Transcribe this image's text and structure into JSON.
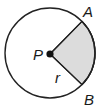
{
  "diagram": {
    "type": "circle-sector",
    "circle": {
      "cx": 50,
      "cy": 53,
      "r": 45,
      "stroke": "#222222",
      "fill": "#ffffff"
    },
    "sector": {
      "fill": "#dcdcdc",
      "stroke": "#222222"
    },
    "points": {
      "A": {
        "x": 82,
        "y": 21
      },
      "B": {
        "x": 82,
        "y": 85
      },
      "P": {
        "x": 50,
        "y": 54
      }
    },
    "labels": {
      "center": "P",
      "point_a": "A",
      "point_b": "B",
      "radius": "r"
    },
    "colors": {
      "line": "#222222",
      "shade": "#dcdcdc",
      "background": "#ffffff"
    }
  }
}
